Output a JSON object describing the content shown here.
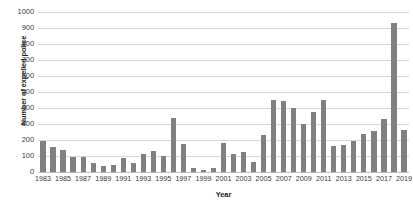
{
  "chart_data": {
    "type": "bar",
    "title": "",
    "xlabel": "Year",
    "ylabel": "Number of expelled police",
    "ylim": [
      0,
      1000
    ],
    "ytick_step": 100,
    "yticks": [
      0,
      100,
      200,
      300,
      400,
      500,
      600,
      700,
      800,
      900,
      1000
    ],
    "grid": true,
    "legend": "none",
    "xtick_interval": 2,
    "xticks": [
      1983,
      1985,
      1987,
      1989,
      1991,
      1993,
      1995,
      1997,
      1999,
      2001,
      2003,
      2005,
      2007,
      2009,
      2011,
      2013,
      2015,
      2017,
      2019
    ],
    "bar_color": "#808080",
    "grid_color": "#d9d9d9",
    "axis_color": "#bfbfbf",
    "categories": [
      1983,
      1984,
      1985,
      1986,
      1987,
      1988,
      1989,
      1990,
      1991,
      1992,
      1993,
      1994,
      1995,
      1996,
      1997,
      1998,
      1999,
      2000,
      2001,
      2002,
      2003,
      2004,
      2005,
      2006,
      2007,
      2008,
      2009,
      2010,
      2011,
      2012,
      2013,
      2014,
      2015,
      2016,
      2017,
      2018,
      2019
    ],
    "values": [
      195,
      155,
      135,
      95,
      95,
      55,
      40,
      45,
      90,
      55,
      115,
      130,
      100,
      340,
      175,
      25,
      15,
      25,
      180,
      110,
      125,
      60,
      230,
      450,
      445,
      400,
      300,
      375,
      450,
      160,
      170,
      195,
      240,
      255,
      330,
      930,
      265
    ],
    "series_name": "Number of expelled police"
  }
}
